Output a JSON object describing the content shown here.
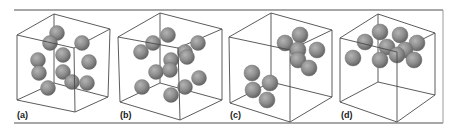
{
  "figure": {
    "colors": {
      "background": "#ffffff",
      "rule": "#8a8a8a",
      "edge": "#4a4a4a",
      "sphere_light": "#b4b4b4",
      "sphere_mid": "#8c8c8c",
      "sphere_dark": "#5e5e5e"
    },
    "panels": [
      {
        "label": "(a)",
        "label_pos": [
          17,
          118
        ],
        "cube": {
          "front": [
            [
              17,
              35
            ],
            [
              74,
              48
            ],
            [
              75,
              112
            ],
            [
              17,
              100
            ]
          ],
          "back": [
            [
              54,
              14
            ],
            [
              110,
              29
            ],
            [
              108,
              97
            ],
            [
              54,
              83
            ]
          ]
        },
        "sphere_radius": 7.5,
        "spheres": [
          [
            57,
            33
          ],
          [
            50,
            43
          ],
          [
            82,
            43
          ],
          [
            38,
            60
          ],
          [
            63,
            55
          ],
          [
            89,
            62
          ],
          [
            39,
            73
          ],
          [
            63,
            72
          ],
          [
            72,
            82
          ],
          [
            87,
            83
          ],
          [
            48,
            88
          ]
        ]
      },
      {
        "label": "(b)",
        "label_pos": [
          120,
          118
        ],
        "cube": {
          "front": [
            [
              118,
              37
            ],
            [
              178,
              48
            ],
            [
              180,
              120
            ],
            [
              120,
              102
            ]
          ],
          "back": [
            [
              160,
              13
            ],
            [
              222,
              29
            ],
            [
              222,
              100
            ],
            [
              160,
              83
            ]
          ]
        },
        "sphere_radius": 7.5,
        "spheres": [
          [
            168,
            35
          ],
          [
            153,
            43
          ],
          [
            141,
            52
          ],
          [
            198,
            43
          ],
          [
            185,
            52
          ],
          [
            187,
            57
          ],
          [
            171,
            60
          ],
          [
            156,
            72
          ],
          [
            170,
            70
          ],
          [
            142,
            87
          ],
          [
            199,
            78
          ],
          [
            185,
            87
          ],
          [
            171,
            95
          ]
        ]
      },
      {
        "label": "(c)",
        "label_pos": [
          230,
          118
        ],
        "cube": {
          "front": [
            [
              229,
              37
            ],
            [
              290,
              50
            ],
            [
              290,
              122
            ],
            [
              230,
              103
            ]
          ],
          "back": [
            [
              271,
              13
            ],
            [
              332,
              30
            ],
            [
              332,
              97
            ],
            [
              271,
              82
            ]
          ]
        },
        "sphere_radius": 8,
        "spheres": [
          [
            300,
            35
          ],
          [
            285,
            43
          ],
          [
            317,
            50
          ],
          [
            298,
            50
          ],
          [
            298,
            60
          ],
          [
            309,
            68
          ],
          [
            252,
            73
          ],
          [
            270,
            83
          ],
          [
            253,
            90
          ],
          [
            267,
            100
          ]
        ]
      },
      {
        "label": "(d)",
        "label_pos": [
          341,
          118
        ],
        "cube": {
          "front": [
            [
              340,
              38
            ],
            [
              397,
              52
            ],
            [
              397,
              122
            ],
            [
              340,
              102
            ]
          ],
          "back": [
            [
              378,
              14
            ],
            [
              435,
              33
            ],
            [
              435,
              95
            ],
            [
              378,
              82
            ]
          ]
        },
        "sphere_radius": 8,
        "spheres": [
          [
            380,
            32
          ],
          [
            400,
            35
          ],
          [
            365,
            42
          ],
          [
            387,
            47
          ],
          [
            417,
            43
          ],
          [
            405,
            50
          ],
          [
            353,
            58
          ],
          [
            380,
            60
          ],
          [
            397,
            55
          ],
          [
            414,
            60
          ]
        ]
      }
    ],
    "rules": {
      "top": [
        14,
        10,
        443,
        10
      ],
      "bottom": [
        14,
        123,
        443,
        123
      ]
    },
    "right_frame": [
      337,
      10,
      443,
      123
    ]
  }
}
